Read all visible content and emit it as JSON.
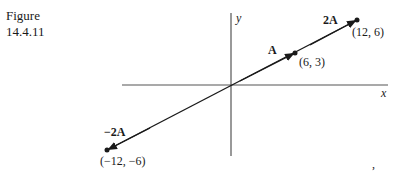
{
  "caption": {
    "line1": "Figure",
    "line2": "14.4.11"
  },
  "axes": {
    "x_label": "x",
    "y_label": "y"
  },
  "vectors": [
    {
      "label": "A",
      "point_label": "(6, 3)",
      "x": 6,
      "y": 3
    },
    {
      "label": "2A",
      "point_label": "(12, 6)",
      "x": 12,
      "y": 6
    },
    {
      "label": "−2A",
      "point_label": "(−12, −6)",
      "x": -12,
      "y": -6
    }
  ],
  "colors": {
    "ink": "#1a1a1a",
    "axis": "#555555"
  }
}
